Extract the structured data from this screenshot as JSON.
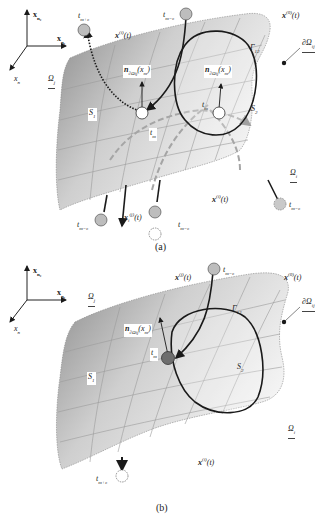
{
  "panels": [
    {
      "id": "a",
      "caption": "(a)",
      "axes": {
        "x_up": "x",
        "x_up_sub": "n₂",
        "x_right": "x",
        "x_right_sub": "n₁",
        "x_diag": "x",
        "x_diag_sub": "n"
      },
      "labels": {
        "t_m_plus_e": "t",
        "t_m_plus_e_sub": "m+ε",
        "x_i_t_top": "x",
        "x_i_t_top_sup": "(i)",
        "x_i_t_top_arg": "(t)",
        "t_m_minus_e_top": "t",
        "t_m_minus_e_top_sub": "m−ε",
        "x_0_t": "x",
        "x_0_t_sup": "(0)",
        "x_0_t_arg": "(t)",
        "gamma_12": "Γ",
        "gamma_12_sub": "12",
        "boundary_omega": "∂Ω",
        "boundary_omega_sub": "ij",
        "omega_j": "Ω",
        "omega_j_sub": "j",
        "omega_i": "Ω",
        "omega_i_sub": "i",
        "normal_1": "n",
        "normal_1_sub": "∂Ωij",
        "normal_1_arg": "(x",
        "normal_1_arg_sub": "m",
        "normal_1_close": ")",
        "normal_2": "n",
        "normal_2_sub": "∂Ωij",
        "normal_2_arg": "(x",
        "normal_2_arg_sub": "m",
        "normal_2_close": ")",
        "s1": "S",
        "s1_sub": "1",
        "s2": "S",
        "s2_sub": "2",
        "t_m_left": "t",
        "t_m_left_sub": "m",
        "t_m_right": "t",
        "t_m_right_sub": "m",
        "t_m_minus_e_bl": "t",
        "t_m_minus_e_bl_sub": "m−ε",
        "x_i_t_bottom": "x",
        "x_i_t_bottom_sup": "(j)",
        "x_i_t_bottom_sub": "i",
        "x_i_t_bottom_arg": "(t)",
        "t_m_minus_e_bc": "t",
        "t_m_minus_e_bc_sub": "m−ε",
        "x_1_t": "x",
        "x_1_t_sup": "(i)",
        "x_1_t_arg": "(t)",
        "t_m_minus_e_br": "t",
        "t_m_minus_e_br_sub": "m−ε"
      }
    },
    {
      "id": "b",
      "caption": "(b)",
      "axes": {
        "x_up": "x",
        "x_up_sub": "n₂",
        "x_right": "x",
        "x_right_sub": "n₁",
        "x_diag": "x",
        "x_diag_sub": "n"
      },
      "labels": {
        "x_i_t_top": "x",
        "x_i_t_top_sup": "(j)",
        "x_i_t_top_arg": "(t)",
        "t_m_minus_e_top": "t",
        "t_m_minus_e_top_sub": "m−ε",
        "x_0_t": "x",
        "x_0_t_sup": "(0)",
        "x_0_t_arg": "(t)",
        "gamma_12": "Γ",
        "gamma_12_sub": "12",
        "boundary_omega": "∂Ω",
        "boundary_omega_sub": "ij",
        "omega_j": "Ω",
        "omega_j_sub": "j",
        "omega_i": "Ω",
        "omega_i_sub": "i",
        "normal_1": "n",
        "normal_1_sub": "∂Ωij",
        "normal_1_arg": "(x",
        "normal_1_arg_sub": "m",
        "normal_1_close": ")",
        "s1": "S",
        "s1_sub": "1",
        "s2": "S",
        "s2_sub": "2",
        "t_m": "t",
        "t_m_sub": "m",
        "x_1_t": "x",
        "x_1_t_sup": "(i)",
        "x_1_t_arg": "(t)",
        "t_m_plus_e": "t",
        "t_m_plus_e_sub": "m+ε"
      }
    }
  ],
  "colors": {
    "surface_dark": "#8a8a8a",
    "surface_light": "#f4f4f4",
    "grid_line": "#9a9a9a",
    "curve": "#1a1a1a",
    "point_fill_gray": "#bdbdbd",
    "point_fill_dark": "#6e6e6e",
    "point_fill_white": "#ffffff"
  }
}
